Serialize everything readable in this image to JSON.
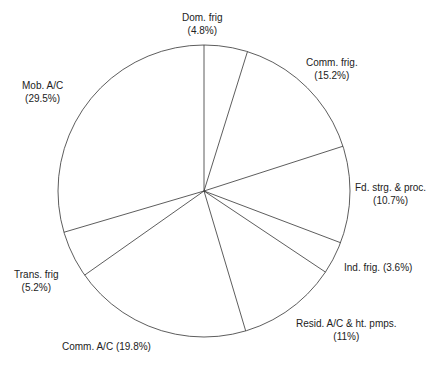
{
  "chart_data": {
    "type": "pie",
    "title": "",
    "start_angle_deg": 0,
    "direction": "clockwise",
    "categories": [
      "Dom. frig",
      "Comm. frig.",
      "Fd. strg. & proc.",
      "Ind. frig.",
      "Resid. A/C & ht. pmps.",
      "Comm. A/C",
      "Trans. frig",
      "Mob. A/C"
    ],
    "values": [
      4.8,
      15.2,
      10.7,
      3.6,
      11,
      19.8,
      5.2,
      29.5
    ],
    "labels": [
      {
        "line1": "Dom. frig",
        "line2": "(4.8%)"
      },
      {
        "line1": "Comm. frig.",
        "line2": "(15.2%)"
      },
      {
        "line1": "Fd. strg. & proc.",
        "line2": "(10.7%)"
      },
      {
        "line1": "Ind. frig. (3.6%)",
        "line2": ""
      },
      {
        "line1": "Resid. A/C & ht. pmps.",
        "line2": "(11%)"
      },
      {
        "line1": "Comm. A/C (19.8%)",
        "line2": ""
      },
      {
        "line1": "Trans. frig",
        "line2": "(5.2%)"
      },
      {
        "line1": "Mob. A/C",
        "line2": "(29.5%)"
      }
    ],
    "colors": {
      "fill": "#ffffff",
      "stroke": "#333333"
    }
  }
}
